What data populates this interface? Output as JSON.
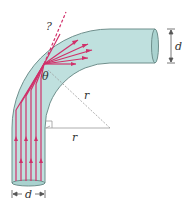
{
  "diagram": {
    "labels": {
      "question": "?",
      "theta": "θ",
      "r_diagonal": "r",
      "r_horizontal": "r",
      "d_right": "d",
      "d_bottom": "d"
    },
    "colors": {
      "pipe_fill": "#bfe0de",
      "pipe_edge": "#6f8f8c",
      "ray": "#d0306a",
      "construction": "#9a9a9a",
      "text": "#333333"
    },
    "geometry": {
      "bend_center": [
        110,
        128
      ],
      "inner_radius": 65,
      "outer_radius": 99,
      "vertical_ray_count": 6
    }
  }
}
